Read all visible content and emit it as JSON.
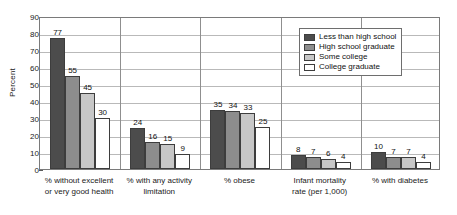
{
  "chart_data": {
    "type": "bar",
    "title": "",
    "xlabel": "",
    "ylabel": "Percent",
    "ylim": [
      0,
      90
    ],
    "yticks": [
      0,
      10,
      20,
      30,
      40,
      50,
      60,
      70,
      80,
      90
    ],
    "grid": true,
    "legend_position": "top-right",
    "categories": [
      "% without excellent\nor very good health",
      "% with any activity\nlimitation",
      "% obese",
      "Infant mortality\nrate (per 1,000)",
      "% with diabetes"
    ],
    "series": [
      {
        "name": "Less than high school",
        "color": "#4c4c4c",
        "values": [
          77,
          24,
          35,
          8,
          10
        ]
      },
      {
        "name": "High school graduate",
        "color": "#8d8d8d",
        "values": [
          55,
          16,
          34,
          7,
          7
        ]
      },
      {
        "name": "Some college",
        "color": "#c7c7c7",
        "values": [
          45,
          15,
          33,
          6,
          7
        ]
      },
      {
        "name": "College graduate",
        "color": "#ffffff",
        "values": [
          30,
          9,
          25,
          4,
          4
        ]
      }
    ]
  },
  "legend": {
    "items": [
      {
        "label": "Less than high school"
      },
      {
        "label": "High school graduate"
      },
      {
        "label": "Some college"
      },
      {
        "label": "College graduate"
      }
    ]
  },
  "axis": {
    "y_title": "Percent",
    "y_tick_labels": [
      "90",
      "80",
      "70",
      "60",
      "50",
      "40",
      "30",
      "20",
      "10",
      "0"
    ]
  }
}
